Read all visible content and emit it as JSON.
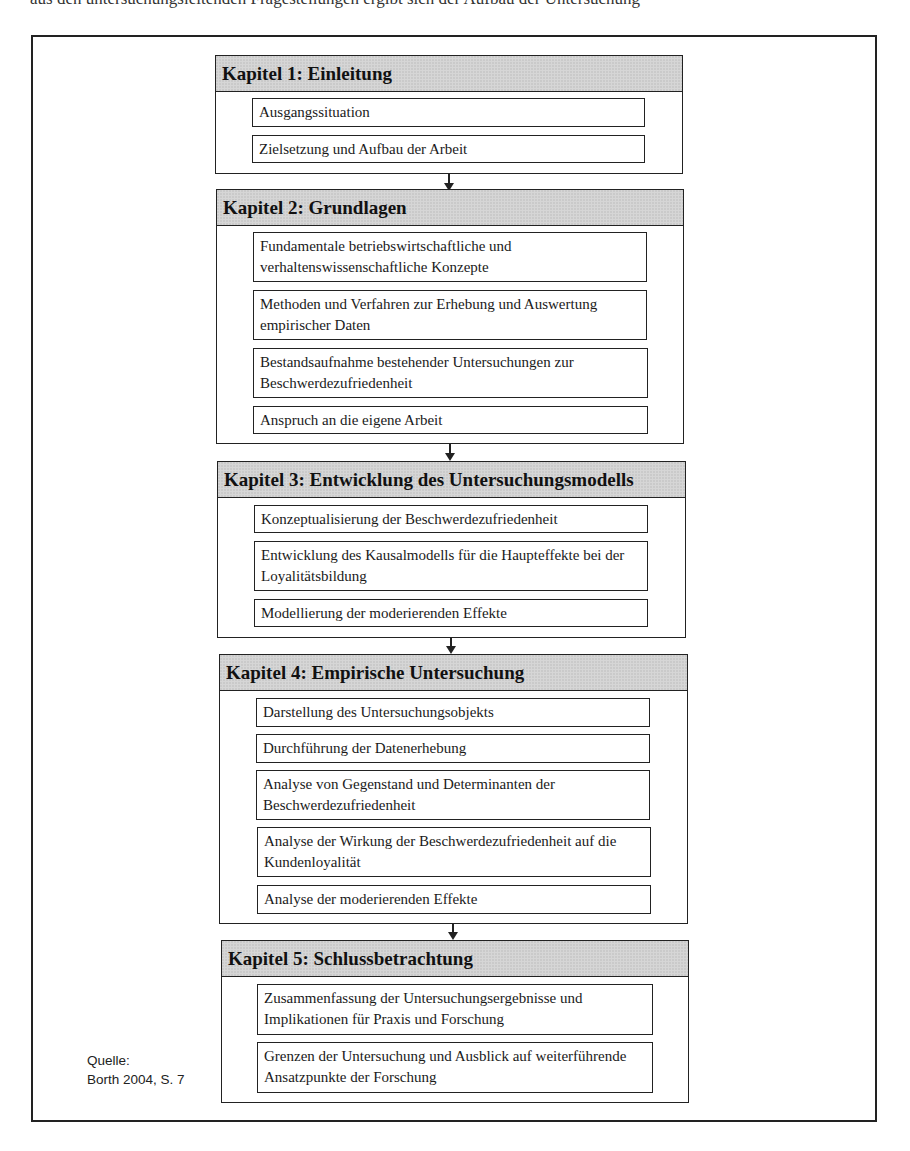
{
  "page": {
    "cut_off_top_text": "aus den untersuchungsleitenden Fragestellungen ergibt sich der Aufbau der Untersuchung"
  },
  "source": {
    "label": "Quelle:",
    "citation": "Borth 2004, S. 7"
  },
  "chapters": [
    {
      "title": "Kapitel 1: Einleitung",
      "items": [
        "Ausgangssituation",
        "Zielsetzung und Aufbau der Arbeit"
      ]
    },
    {
      "title": "Kapitel 2: Grundlagen",
      "items": [
        "Fundamentale betriebswirtschaftliche und verhaltenswissenschaftliche Konzepte",
        "Methoden und Verfahren zur Erhebung und Auswertung empirischer Daten",
        "Bestandsaufnahme bestehender Untersuchungen zur Beschwerdezufriedenheit",
        "Anspruch an die eigene Arbeit"
      ]
    },
    {
      "title": "Kapitel 3: Entwicklung des Untersuchungsmodells",
      "items": [
        "Konzeptualisierung der Beschwerdezufriedenheit",
        "Entwicklung des Kausalmodells für die Haupteffekte bei der Loyalitätsbildung",
        "Modellierung der moderierenden Effekte"
      ]
    },
    {
      "title": "Kapitel 4: Empirische Untersuchung",
      "items": [
        "Darstellung des Untersuchungsobjekts",
        "Durchführung der Datenerhebung",
        "Analyse von Gegenstand und Determinanten der Beschwerdezufriedenheit",
        "Analyse der Wirkung der Beschwerdezufriedenheit auf die Kundenloyalität",
        "Analyse der moderierenden Effekte"
      ]
    },
    {
      "title": "Kapitel 5: Schlussbetrachtung",
      "items": [
        "Zusammenfassung der Untersuchungsergebnisse und Implikationen für Praxis und Forschung",
        "Grenzen der Untersuchung und Ausblick auf weiterführende Ansatzpunkte der Forschung"
      ]
    }
  ],
  "colors": {
    "header_fill": "#d6d6d6",
    "border": "#222222"
  }
}
